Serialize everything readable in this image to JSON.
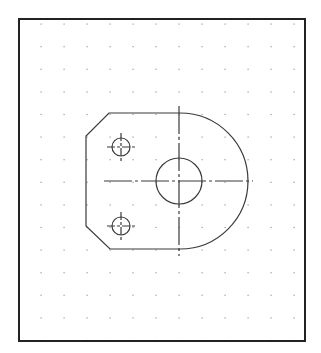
{
  "drawing": {
    "background": "#ffffff",
    "line_color": "#3a3a3a",
    "dot_color": "#9a9a9a",
    "frame": {
      "x": 19,
      "y": 19,
      "width": 286,
      "height": 322
    },
    "grid": {
      "x_start": 41,
      "y_start": 24,
      "spacing_x": 23,
      "spacing_y": 22.6,
      "cols": 12,
      "rows": 15
    },
    "part": {
      "outline_path": "M109,113 L180,113 A68,68 0 0 1 180,249 L110,249 L86,226 L86,136 Z",
      "centerline_vertical": {
        "x": 179,
        "y1": 106,
        "y2": 256
      },
      "centerline_horizontal": {
        "y": 181,
        "x1": 104,
        "x2": 253
      },
      "main_hole": {
        "cx": 179,
        "cy": 181,
        "r": 23
      },
      "small_holes": [
        {
          "cx": 121,
          "cy": 147,
          "r": 9,
          "cross": 14
        },
        {
          "cx": 121,
          "cy": 226,
          "r": 9,
          "cross": 14
        }
      ]
    }
  }
}
